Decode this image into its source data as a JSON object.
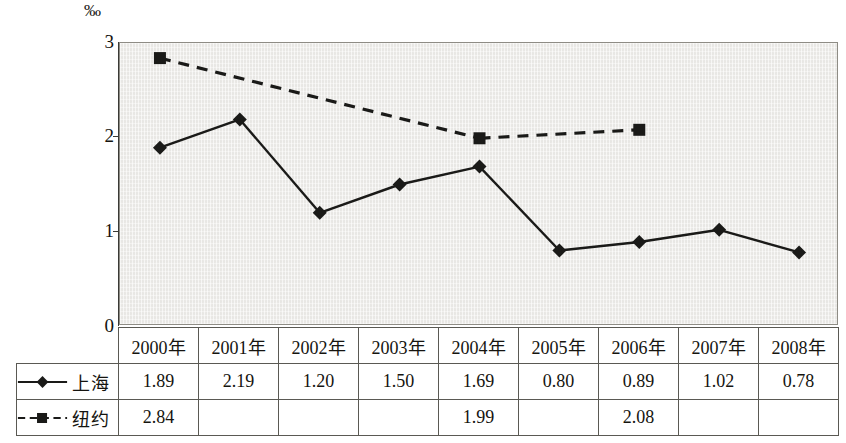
{
  "unit_label": "‰",
  "axis": {
    "y_ticks": [
      "0",
      "1",
      "2",
      "3"
    ],
    "y_min": 0,
    "y_max": 3
  },
  "table": {
    "year_headers": [
      "2000年",
      "2001年",
      "2002年",
      "2003年",
      "2004年",
      "2005年",
      "2006年",
      "2007年",
      "2008年"
    ],
    "rows": [
      {
        "name": "上海",
        "marker": "diamond",
        "line": "solid",
        "values": [
          "1.89",
          "2.19",
          "1.20",
          "1.50",
          "1.69",
          "0.80",
          "0.89",
          "1.02",
          "0.78"
        ]
      },
      {
        "name": "纽约",
        "marker": "square",
        "line": "dashed",
        "values": [
          "2.84",
          "",
          "",
          "",
          "1.99",
          "",
          "2.08",
          "",
          ""
        ]
      }
    ]
  },
  "chart_data": {
    "type": "line",
    "title": "",
    "xlabel": "",
    "ylabel": "‰",
    "ylim": [
      0,
      3
    ],
    "y_ticks": [
      0,
      1,
      2,
      3
    ],
    "grid": false,
    "legend_position": "table-left-column",
    "categories": [
      "2000年",
      "2001年",
      "2002年",
      "2003年",
      "2004年",
      "2005年",
      "2006年",
      "2007年",
      "2008年"
    ],
    "series": [
      {
        "name": "上海",
        "marker": "diamond",
        "line_style": "solid",
        "color": "#1a1a18",
        "values": [
          1.89,
          2.19,
          1.2,
          1.5,
          1.69,
          0.8,
          0.89,
          1.02,
          0.78
        ]
      },
      {
        "name": "纽约",
        "marker": "square",
        "line_style": "dashed",
        "color": "#1a1a18",
        "values": [
          2.84,
          null,
          null,
          null,
          1.99,
          null,
          2.08,
          null,
          null
        ]
      }
    ]
  },
  "colors": {
    "plot_background": "#eeedea",
    "line": "#1a1a18",
    "border": "#5a5953",
    "page_background": "#ffffff"
  }
}
